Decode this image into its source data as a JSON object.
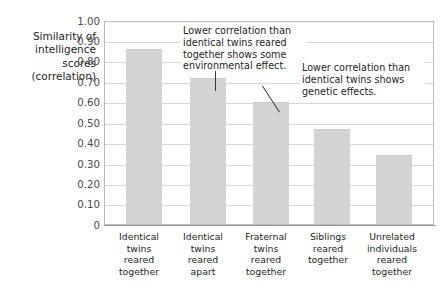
{
  "chart_data": {
    "type": "bar",
    "title": "",
    "xlabel": "",
    "ylabel": "Similarity of intelligence scores (correlation)",
    "ylim": [
      0,
      1.0
    ],
    "grid": true,
    "legend": "none",
    "categories": [
      "Identical twins reared together",
      "Identical twins reared apart",
      "Fraternal twins reared together",
      "Siblings reared together",
      "Unrelated individuals reared together"
    ],
    "values": [
      0.86,
      0.72,
      0.6,
      0.47,
      0.34
    ],
    "ytick_labels": [
      "1.00",
      "0.90",
      "0.80",
      "0.70",
      "0.60",
      "0.50",
      "0.40",
      "0.30",
      "0.20",
      "0.10",
      "0"
    ],
    "ytick_values": [
      1.0,
      0.9,
      0.8,
      0.7,
      0.6,
      0.5,
      0.4,
      0.3,
      0.2,
      0.1,
      0
    ],
    "annotations": [
      "Lower correlation than identical twins reared together shows some environmental effect.",
      "Lower correlation than identical twins shows genetic effects."
    ],
    "bar_color": "#d4d4d4",
    "grid_color": "#d8d8d8",
    "text_color": "#231f20"
  },
  "axis_title": {
    "line1": "Similarity of",
    "line2": "intelligence",
    "line3": "scores",
    "line4": "(correlation)"
  },
  "categories": {
    "cat1": {
      "l1": "Identical",
      "l2": "twins",
      "l3": "reared",
      "l4": "together"
    },
    "cat2": {
      "l1": "Identical",
      "l2": "twins",
      "l3": "reared",
      "l4": "apart"
    },
    "cat3": {
      "l1": "Fraternal",
      "l2": "twins",
      "l3": "reared",
      "l4": "together"
    },
    "cat4": {
      "l1": "Siblings",
      "l2": "reared",
      "l3": "together",
      "l4": ""
    },
    "cat5": {
      "l1": "Unrelated",
      "l2": "individuals",
      "l3": "reared",
      "l4": "together"
    }
  },
  "ticks": {
    "t0": "1.00",
    "t1": "0.90",
    "t2": "0.80",
    "t3": "0.70",
    "t4": "0.60",
    "t5": "0.50",
    "t6": "0.40",
    "t7": "0.30",
    "t8": "0.20",
    "t9": "0.10",
    "t10": "0"
  },
  "annotations": {
    "a1": "Lower correlation than identical twins reared together shows some environmental effect.",
    "a2": "Lower correlation than identical twins shows genetic effects."
  }
}
